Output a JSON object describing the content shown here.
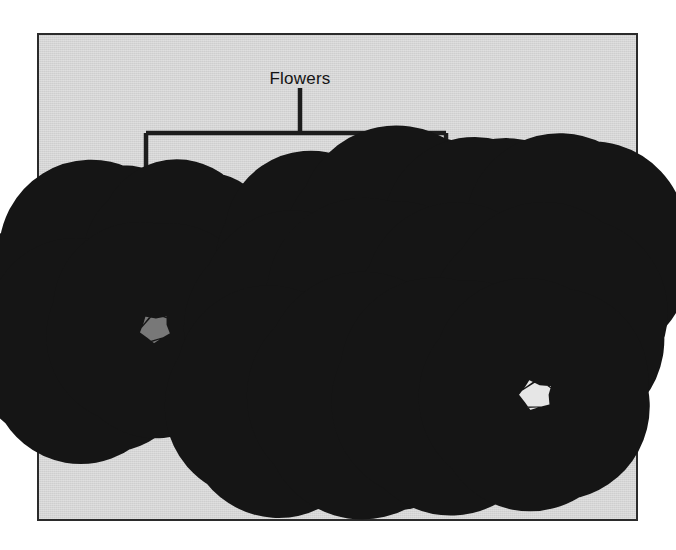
{
  "figure": {
    "type": "tree-diagram",
    "title_node": "Flowers",
    "background_color": "#d4d4d4",
    "frame_color": "#2b2b2b",
    "line_color": "#1d1d1d"
  },
  "tree": {
    "root": {
      "label": "Flowers",
      "x": 300,
      "y": 78
    },
    "children": [
      {
        "label": "Blue Flowers",
        "label_x": 146,
        "label_y": 429,
        "count": 4,
        "flower_fill": "#787878",
        "flower_outline": "#151515",
        "bracket": {
          "x1": 60,
          "x2": 224,
          "y": 210,
          "tick_depth": 22
        },
        "flowers": [
          {
            "cx": 105,
            "cy": 278,
            "r": 33,
            "rot": 8
          },
          {
            "cx": 182,
            "cy": 262,
            "r": 28,
            "rot": 24
          },
          {
            "cx": 86,
            "cy": 354,
            "r": 32,
            "rot": 15
          },
          {
            "cx": 156,
            "cy": 331,
            "r": 31,
            "rot": 0
          }
        ]
      },
      {
        "label": "Yellow Flowers",
        "label_x": 441,
        "label_y": 467,
        "count": 12,
        "flower_fill": "#e6e6e6",
        "flower_outline": "#151515",
        "bracket": {
          "x1": 268,
          "x2": 626,
          "y": 210,
          "tick_depth": 22
        },
        "flowers": [
          {
            "cx": 325,
            "cy": 261,
            "r": 31,
            "rot": 5
          },
          {
            "cx": 406,
            "cy": 253,
            "r": 35,
            "rot": 18
          },
          {
            "cx": 492,
            "cy": 253,
            "r": 33,
            "rot": 0
          },
          {
            "cx": 572,
            "cy": 256,
            "r": 34,
            "rot": 12
          },
          {
            "cx": 301,
            "cy": 331,
            "r": 33,
            "rot": 20
          },
          {
            "cx": 381,
            "cy": 322,
            "r": 35,
            "rot": 4
          },
          {
            "cx": 468,
            "cy": 322,
            "r": 33,
            "rot": 14
          },
          {
            "cx": 549,
            "cy": 327,
            "r": 34,
            "rot": 26
          },
          {
            "cx": 282,
            "cy": 404,
            "r": 33,
            "rot": 9
          },
          {
            "cx": 371,
            "cy": 400,
            "r": 35,
            "rot": 22
          },
          {
            "cx": 452,
            "cy": 398,
            "r": 34,
            "rot": 3
          },
          {
            "cx": 536,
            "cy": 398,
            "r": 33,
            "rot": 16
          }
        ]
      }
    ]
  },
  "frame": {
    "left": 37,
    "top": 33,
    "width": 601,
    "height": 488
  },
  "chart_data": {
    "type": "tree",
    "title": "Flowers",
    "categories": [
      "Blue Flowers",
      "Yellow Flowers"
    ],
    "values": [
      4,
      12
    ],
    "xlabel": "",
    "ylabel": "Number of flowers"
  }
}
